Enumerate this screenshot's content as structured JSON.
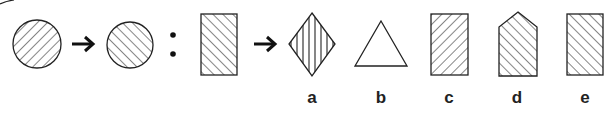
{
  "puzzle": {
    "type": "figure-analogy",
    "premise": {
      "source": {
        "shape": "circle",
        "hatch": "diagonal-forward"
      },
      "target": {
        "shape": "circle",
        "hatch": "diagonal-backward"
      },
      "separator": ":"
    },
    "query": {
      "shape": "rectangle",
      "hatch": "diagonal-backward"
    },
    "options": [
      {
        "label": "a",
        "shape": "diamond",
        "hatch": "vertical"
      },
      {
        "label": "b",
        "shape": "triangle",
        "hatch": "none"
      },
      {
        "label": "c",
        "shape": "rectangle",
        "hatch": "diagonal-forward"
      },
      {
        "label": "d",
        "shape": "pentagon",
        "hatch": "diagonal-backward"
      },
      {
        "label": "e",
        "shape": "rectangle",
        "hatch": "diagonal-backward"
      }
    ],
    "arrow_glyph": "arrow-right-icon",
    "colors": {
      "stroke": "#222222",
      "background": "#ffffff"
    }
  }
}
